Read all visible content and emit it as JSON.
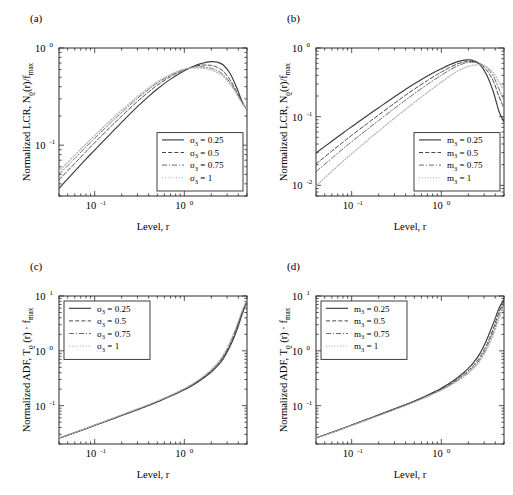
{
  "figure": {
    "panels": [
      {
        "id": "a",
        "label": "(a)",
        "xlabel": "Level, r",
        "ylabel_parts": {
          "main": "Normalized LCR, N",
          "sub1": "ϱ",
          "mid": "(r)/f",
          "sub2": "max"
        },
        "legend_position": "bottom-right",
        "legend_title_symbol": "σ",
        "legend_sub": "3",
        "legend": [
          {
            "label": "σ",
            "sub": "3",
            "value": "= 0.25",
            "style": "solid"
          },
          {
            "label": "σ",
            "sub": "3",
            "value": "= 0.5",
            "style": "dashed"
          },
          {
            "label": "σ",
            "sub": "3",
            "value": "= 0.75",
            "style": "dashdot"
          },
          {
            "label": "σ",
            "sub": "3",
            "value": "= 1",
            "style": "dotted"
          }
        ],
        "xticks": [
          {
            "exp": "-1"
          },
          {
            "exp": "0"
          }
        ],
        "yticks": [
          {
            "exp": "0"
          },
          {
            "exp": "-1"
          }
        ]
      },
      {
        "id": "b",
        "label": "(b)",
        "xlabel": "Level, r",
        "ylabel_parts": {
          "main": "Normalized LCR, N",
          "sub1": "ϱ",
          "mid": "(r)/f",
          "sub2": "max"
        },
        "legend_position": "bottom-right",
        "legend_title_symbol": "m",
        "legend_sub": "3",
        "legend": [
          {
            "label": "m",
            "sub": "3",
            "value": "= 0.25",
            "style": "solid"
          },
          {
            "label": "m",
            "sub": "3",
            "value": "= 0.5",
            "style": "dashed"
          },
          {
            "label": "m",
            "sub": "3",
            "value": "= 0.75",
            "style": "dashdot"
          },
          {
            "label": "m",
            "sub": "3",
            "value": "= 1",
            "style": "dotted"
          }
        ],
        "xticks": [
          {
            "exp": "-1"
          },
          {
            "exp": "0"
          }
        ],
        "yticks": [
          {
            "exp": "0"
          },
          {
            "exp": "-1"
          },
          {
            "exp": "-2"
          }
        ]
      },
      {
        "id": "c",
        "label": "(c)",
        "xlabel": "Level, r",
        "ylabel_parts": {
          "main": "Normalized ADF, T",
          "sub1": "ϱ",
          "mid": " (r) · f",
          "sub2": "max"
        },
        "legend_position": "top-left",
        "legend_title_symbol": "σ",
        "legend_sub": "3",
        "legend": [
          {
            "label": "σ",
            "sub": "3",
            "value": "= 0.25",
            "style": "solid"
          },
          {
            "label": "σ",
            "sub": "3",
            "value": "= 0.5",
            "style": "dashed"
          },
          {
            "label": "σ",
            "sub": "3",
            "value": "= 0.75",
            "style": "dashdot"
          },
          {
            "label": "σ",
            "sub": "3",
            "value": "= 1",
            "style": "dotted"
          }
        ],
        "xticks": [
          {
            "exp": "-1"
          },
          {
            "exp": "0"
          }
        ],
        "yticks": [
          {
            "exp": "1"
          },
          {
            "exp": "0"
          },
          {
            "exp": "-1"
          }
        ]
      },
      {
        "id": "d",
        "label": "(d)",
        "xlabel": "Level, r",
        "ylabel_parts": {
          "main": "Normalized ADF, T",
          "sub1": "ϱ",
          "mid": " (r) · f",
          "sub2": "max"
        },
        "legend_position": "top-left",
        "legend_title_symbol": "m",
        "legend_sub": "3",
        "legend": [
          {
            "label": "m",
            "sub": "3",
            "value": "= 0.25",
            "style": "solid"
          },
          {
            "label": "m",
            "sub": "3",
            "value": "= 0.5",
            "style": "dashed"
          },
          {
            "label": "m",
            "sub": "3",
            "value": "= 0.75",
            "style": "dashdot"
          },
          {
            "label": "m",
            "sub": "3",
            "value": "= 1",
            "style": "dotted"
          }
        ],
        "xticks": [
          {
            "exp": "-1"
          },
          {
            "exp": "0"
          }
        ],
        "yticks": [
          {
            "exp": "1"
          },
          {
            "exp": "0"
          },
          {
            "exp": "-1"
          }
        ]
      }
    ]
  },
  "chart_data": [
    {
      "type": "line",
      "panel": "a",
      "title": "(a)",
      "xlabel": "Level, r",
      "ylabel": "Normalized LCR, N_ϱ(r)/f_max",
      "xscale": "log",
      "yscale": "log",
      "xlim": [
        0.04,
        5.0
      ],
      "ylim": [
        0.03,
        1.0
      ],
      "grid": false,
      "legend_position": "lower right",
      "x": [
        0.04,
        0.06,
        0.08,
        0.1,
        0.15,
        0.2,
        0.3,
        0.4,
        0.5,
        0.7,
        0.9,
        1.0,
        1.2,
        1.5,
        1.8,
        2.0,
        2.3,
        2.7,
        3.2,
        3.8,
        4.4,
        5.0
      ],
      "series": [
        {
          "name": "σ_3 = 0.25",
          "style": "solid",
          "values": [
            0.036,
            0.054,
            0.072,
            0.089,
            0.131,
            0.172,
            0.249,
            0.318,
            0.379,
            0.478,
            0.552,
            0.582,
            0.634,
            0.686,
            0.716,
            0.724,
            0.718,
            0.672,
            0.556,
            0.4,
            0.282,
            0.23
          ]
        },
        {
          "name": "σ_3 = 0.5",
          "style": "dashed",
          "values": [
            0.044,
            0.065,
            0.086,
            0.106,
            0.154,
            0.199,
            0.282,
            0.353,
            0.414,
            0.508,
            0.573,
            0.598,
            0.636,
            0.664,
            0.667,
            0.66,
            0.636,
            0.58,
            0.478,
            0.362,
            0.276,
            0.232
          ]
        },
        {
          "name": "σ_3 = 0.75",
          "style": "dashdot",
          "values": [
            0.05,
            0.073,
            0.096,
            0.118,
            0.169,
            0.217,
            0.303,
            0.375,
            0.436,
            0.525,
            0.583,
            0.603,
            0.629,
            0.64,
            0.63,
            0.618,
            0.589,
            0.535,
            0.448,
            0.348,
            0.273,
            0.234
          ]
        },
        {
          "name": "σ_3 = 1",
          "style": "dotted",
          "values": [
            0.054,
            0.079,
            0.103,
            0.126,
            0.18,
            0.229,
            0.317,
            0.389,
            0.449,
            0.534,
            0.587,
            0.603,
            0.622,
            0.624,
            0.608,
            0.593,
            0.563,
            0.512,
            0.432,
            0.341,
            0.272,
            0.236
          ]
        }
      ]
    },
    {
      "type": "line",
      "panel": "b",
      "title": "(b)",
      "xlabel": "Level, r",
      "ylabel": "Normalized LCR, N_ϱ(r)/f_max",
      "xscale": "log",
      "yscale": "log",
      "xlim": [
        0.04,
        5.0
      ],
      "ylim": [
        0.007,
        1.0
      ],
      "grid": false,
      "legend_position": "lower right",
      "x": [
        0.04,
        0.06,
        0.08,
        0.1,
        0.15,
        0.2,
        0.3,
        0.4,
        0.5,
        0.7,
        0.9,
        1.0,
        1.2,
        1.5,
        1.8,
        2.0,
        2.3,
        2.7,
        3.2,
        3.8,
        4.4,
        5.0
      ],
      "series": [
        {
          "name": "m_3 = 0.25",
          "style": "solid",
          "values": [
            0.0295,
            0.044,
            0.058,
            0.0715,
            0.104,
            0.135,
            0.195,
            0.25,
            0.301,
            0.391,
            0.466,
            0.499,
            0.559,
            0.629,
            0.666,
            0.672,
            0.653,
            0.574,
            0.409,
            0.231,
            0.119,
            0.085
          ]
        },
        {
          "name": "m_3 = 0.5",
          "style": "dashed",
          "values": [
            0.0205,
            0.0315,
            0.0425,
            0.0535,
            0.08,
            0.106,
            0.157,
            0.206,
            0.252,
            0.337,
            0.412,
            0.446,
            0.508,
            0.584,
            0.627,
            0.639,
            0.631,
            0.584,
            0.476,
            0.329,
            0.197,
            0.133
          ]
        },
        {
          "name": "m_3 = 0.75",
          "style": "dashdot",
          "values": [
            0.0158,
            0.0248,
            0.034,
            0.0432,
            0.0657,
            0.088,
            0.132,
            0.175,
            0.217,
            0.296,
            0.368,
            0.402,
            0.465,
            0.546,
            0.597,
            0.615,
            0.618,
            0.593,
            0.515,
            0.389,
            0.253,
            0.179
          ]
        },
        {
          "name": "m_3 = 1",
          "style": "dotted",
          "values": [
            0.0098,
            0.016,
            0.0224,
            0.0289,
            0.0452,
            0.0617,
            0.095,
            0.128,
            0.161,
            0.226,
            0.288,
            0.318,
            0.377,
            0.458,
            0.514,
            0.54,
            0.562,
            0.567,
            0.529,
            0.44,
            0.318,
            0.239
          ]
        }
      ]
    },
    {
      "type": "line",
      "panel": "c",
      "title": "(c)",
      "xlabel": "Level, r",
      "ylabel": "Normalized ADF, T_ϱ (r) · f_max",
      "xscale": "log",
      "yscale": "log",
      "xlim": [
        0.04,
        5.0
      ],
      "ylim": [
        0.02,
        10.0
      ],
      "grid": false,
      "legend_position": "upper left",
      "x": [
        0.04,
        0.06,
        0.08,
        0.1,
        0.15,
        0.2,
        0.3,
        0.4,
        0.5,
        0.7,
        0.9,
        1.0,
        1.2,
        1.5,
        1.8,
        2.0,
        2.3,
        2.7,
        3.2,
        3.8,
        4.4,
        5.0
      ],
      "series": [
        {
          "name": "σ_3 = 0.25",
          "style": "solid",
          "values": [
            0.0255,
            0.032,
            0.038,
            0.0435,
            0.0555,
            0.066,
            0.0845,
            0.101,
            0.117,
            0.148,
            0.179,
            0.195,
            0.229,
            0.288,
            0.358,
            0.412,
            0.513,
            0.708,
            1.16,
            2.25,
            4.6,
            8.2
          ]
        },
        {
          "name": "σ_3 = 0.5",
          "style": "dashed",
          "values": [
            0.0256,
            0.0322,
            0.0383,
            0.0439,
            0.0561,
            0.0668,
            0.0857,
            0.1025,
            0.1188,
            0.1505,
            0.1825,
            0.199,
            0.2345,
            0.297,
            0.372,
            0.43,
            0.54,
            0.755,
            1.26,
            2.48,
            5.0,
            8.4
          ]
        },
        {
          "name": "σ_3 = 0.75",
          "style": "dashdot",
          "values": [
            0.0257,
            0.0324,
            0.0386,
            0.0442,
            0.0566,
            0.0675,
            0.0867,
            0.1038,
            0.1204,
            0.1527,
            0.1855,
            0.2025,
            0.2392,
            0.3045,
            0.3835,
            0.445,
            0.563,
            0.795,
            1.34,
            2.64,
            5.2,
            8.5
          ]
        },
        {
          "name": "σ_3 = 1",
          "style": "dotted",
          "values": [
            0.0258,
            0.0326,
            0.0388,
            0.0445,
            0.057,
            0.068,
            0.0875,
            0.1048,
            0.1216,
            0.1545,
            0.188,
            0.2053,
            0.243,
            0.3105,
            0.3925,
            0.4565,
            0.58,
            0.825,
            1.4,
            2.76,
            5.35,
            8.6
          ]
        }
      ]
    },
    {
      "type": "line",
      "panel": "d",
      "title": "(d)",
      "xlabel": "Level, r",
      "ylabel": "Normalized ADF, T_ϱ (r) · f_max",
      "xscale": "log",
      "yscale": "log",
      "xlim": [
        0.04,
        5.0
      ],
      "ylim": [
        0.02,
        10.0
      ],
      "grid": false,
      "legend_position": "upper left",
      "x": [
        0.04,
        0.06,
        0.08,
        0.1,
        0.15,
        0.2,
        0.3,
        0.4,
        0.5,
        0.7,
        0.9,
        1.0,
        1.2,
        1.5,
        1.8,
        2.0,
        2.3,
        2.7,
        3.2,
        3.8,
        4.4,
        5.0
      ],
      "series": [
        {
          "name": "m_3 = 0.25",
          "style": "solid",
          "values": [
            0.0258,
            0.0326,
            0.0388,
            0.0445,
            0.057,
            0.068,
            0.0876,
            0.105,
            0.122,
            0.1555,
            0.19,
            0.208,
            0.2475,
            0.319,
            0.408,
            0.479,
            0.618,
            0.9,
            1.58,
            3.15,
            6.0,
            8.6
          ]
        },
        {
          "name": "m_3 = 0.5",
          "style": "dashed",
          "values": [
            0.0257,
            0.0324,
            0.0385,
            0.0442,
            0.0565,
            0.0673,
            0.0864,
            0.1033,
            0.1197,
            0.1515,
            0.184,
            0.2005,
            0.2365,
            0.2995,
            0.376,
            0.435,
            0.548,
            0.77,
            1.29,
            2.54,
            5.1,
            7.9
          ]
        },
        {
          "name": "m_3 = 0.75",
          "style": "dashdot",
          "values": [
            0.0256,
            0.0322,
            0.0382,
            0.0438,
            0.0559,
            0.0665,
            0.0852,
            0.1018,
            0.1178,
            0.1488,
            0.18,
            0.1958,
            0.2298,
            0.2885,
            0.3585,
            0.412,
            0.512,
            0.705,
            1.15,
            2.21,
            4.4,
            7.2
          ]
        },
        {
          "name": "m_3 = 1",
          "style": "dotted",
          "values": [
            0.0255,
            0.032,
            0.0379,
            0.0434,
            0.0553,
            0.0657,
            0.084,
            0.1002,
            0.1158,
            0.1458,
            0.1758,
            0.1908,
            0.223,
            0.278,
            0.3425,
            0.3915,
            0.481,
            0.653,
            1.045,
            1.97,
            3.85,
            6.4
          ]
        }
      ]
    }
  ]
}
